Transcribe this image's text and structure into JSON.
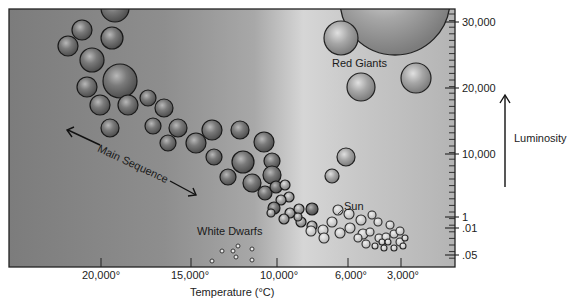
{
  "chart_data": {
    "type": "scatter",
    "xlabel": "Temperature (°C)",
    "ylabel": "Luminosity",
    "x_axis": {
      "reversed": true,
      "tick_labels": [
        "20,000°",
        "15,000°",
        "10,000°",
        "6,000°",
        "3,000°"
      ],
      "tick_px": [
        101,
        191,
        277,
        348,
        401
      ]
    },
    "y_axis": {
      "position": "right",
      "tick_labels": [
        "30,000",
        "20,000",
        "10,000",
        "1",
        ".01",
        ".05"
      ],
      "tick_px": [
        22,
        88,
        154,
        217,
        228,
        255
      ]
    },
    "grid": false,
    "background": "horizontal gray gradient, dark left to light center",
    "annotations": [
      {
        "text": "Red Giants",
        "x": 333,
        "y": 60
      },
      {
        "text": "Main Sequence",
        "x": 100,
        "y": 140,
        "rotation": 25,
        "double_arrow": true
      },
      {
        "text": "White Dwarfs",
        "x": 196,
        "y": 228
      },
      {
        "text": "Sun",
        "x": 344,
        "y": 202
      }
    ],
    "groups": [
      {
        "name": "Main Sequence",
        "fill": "#777777",
        "count": 58
      },
      {
        "name": "Red Giants",
        "fill": "#8a8a8a",
        "count": 4
      },
      {
        "name": "Sun-like / cool stars",
        "fill": "none",
        "count": 28
      },
      {
        "name": "White Dwarfs",
        "fill": "none",
        "count": 7
      }
    ]
  },
  "labels": {
    "xlabel": "Temperature (°C)",
    "ylabel": "Luminosity",
    "red_giants": "Red Giants",
    "main_sequence": "Main Sequence",
    "white_dwarfs": "White Dwarfs",
    "sun": "Sun",
    "x_ticks": [
      "20,000°",
      "15,000°",
      "10,000°",
      "6,000°",
      "3,000°"
    ],
    "y_ticks": [
      "30,000",
      "20,000",
      "10,000",
      "1",
      ".01",
      ".05"
    ]
  },
  "stars": {
    "main_sequence": [
      [
        115,
        8,
        14
      ],
      [
        82,
        30,
        10
      ],
      [
        112,
        38,
        11
      ],
      [
        68,
        46,
        10
      ],
      [
        92,
        60,
        12
      ],
      [
        120,
        81,
        17
      ],
      [
        87,
        87,
        10
      ],
      [
        100,
        105,
        10
      ],
      [
        128,
        105,
        10
      ],
      [
        110,
        128,
        9
      ],
      [
        148,
        98,
        8
      ],
      [
        164,
        108,
        9
      ],
      [
        153,
        126,
        8
      ],
      [
        178,
        128,
        9
      ],
      [
        168,
        143,
        8
      ],
      [
        196,
        143,
        10
      ],
      [
        212,
        130,
        10
      ],
      [
        240,
        130,
        9
      ],
      [
        214,
        157,
        8
      ],
      [
        243,
        162,
        11
      ],
      [
        264,
        142,
        10
      ],
      [
        228,
        177,
        8
      ],
      [
        252,
        183,
        9
      ],
      [
        272,
        161,
        8
      ],
      [
        272,
        175,
        9
      ],
      [
        265,
        193,
        7
      ],
      [
        276,
        187,
        6
      ],
      [
        285,
        185,
        5
      ],
      [
        289,
        197,
        5
      ],
      [
        281,
        200,
        5
      ],
      [
        274,
        208,
        6
      ],
      [
        290,
        213,
        5
      ],
      [
        299,
        209,
        5
      ],
      [
        284,
        219,
        5
      ],
      [
        301,
        222,
        5
      ],
      [
        312,
        209,
        6
      ],
      [
        312,
        226,
        5
      ],
      [
        298,
        217,
        4
      ],
      [
        271,
        213,
        4
      ]
    ],
    "red_giants_filled": [
      [
        341,
        38,
        17
      ],
      [
        361,
        87,
        14
      ],
      [
        416,
        78,
        15
      ],
      [
        346,
        157,
        9
      ],
      [
        332,
        176,
        7
      ]
    ],
    "big_giant": [
      395,
      0,
      55
    ],
    "sun_like": [
      [
        311,
        231,
        5
      ],
      [
        323,
        230,
        5
      ],
      [
        332,
        222,
        5
      ],
      [
        338,
        210,
        5
      ],
      [
        349,
        214,
        5
      ],
      [
        350,
        228,
        5
      ],
      [
        361,
        220,
        5
      ],
      [
        363,
        234,
        5
      ],
      [
        372,
        215,
        4
      ],
      [
        378,
        222,
        4
      ],
      [
        379,
        238,
        4
      ],
      [
        386,
        237,
        4
      ],
      [
        390,
        225,
        4
      ],
      [
        394,
        234,
        4
      ],
      [
        400,
        231,
        4
      ],
      [
        400,
        242,
        4
      ],
      [
        382,
        242,
        3
      ],
      [
        384,
        248,
        3
      ],
      [
        394,
        248,
        3
      ],
      [
        403,
        246,
        3
      ],
      [
        370,
        232,
        4
      ],
      [
        324,
        238,
        5
      ],
      [
        340,
        233,
        5
      ],
      [
        358,
        238,
        4
      ],
      [
        366,
        244,
        4
      ],
      [
        375,
        246,
        3
      ],
      [
        388,
        242,
        3
      ],
      [
        405,
        238,
        3
      ]
    ],
    "white_dwarfs": [
      [
        212,
        261,
        2
      ],
      [
        222,
        251,
        2
      ],
      [
        233,
        251,
        2
      ],
      [
        238,
        246,
        2
      ],
      [
        236,
        257,
        2
      ],
      [
        252,
        249,
        2
      ],
      [
        252,
        260,
        2
      ]
    ]
  }
}
